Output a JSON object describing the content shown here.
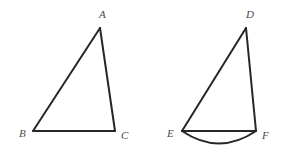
{
  "figure": {
    "background_color": "#ffffff",
    "stroke_color": "#262626",
    "label_color": "#4a4a4a",
    "stroke_width": 2,
    "shapes": [
      {
        "name": "triangle-abc",
        "type": "triangle",
        "vertices": [
          {
            "label": "A",
            "x": 100,
            "y": 28,
            "label_x": 99,
            "label_y": 9
          },
          {
            "label": "B",
            "x": 33,
            "y": 131,
            "label_x": 19,
            "label_y": 128
          },
          {
            "label": "C",
            "x": 115,
            "y": 131,
            "label_x": 121,
            "label_y": 130
          }
        ]
      },
      {
        "name": "triangle-def",
        "type": "triangle-with-arc",
        "vertices": [
          {
            "label": "D",
            "x": 246,
            "y": 28,
            "label_x": 246,
            "label_y": 9
          },
          {
            "label": "E",
            "x": 182,
            "y": 131,
            "label_x": 167,
            "label_y": 128
          },
          {
            "label": "F",
            "x": 256,
            "y": 131,
            "label_x": 262,
            "label_y": 130
          }
        ],
        "arc": {
          "name": "arc-ef",
          "from_x": 182,
          "from_y": 131,
          "to_x": 256,
          "to_y": 131,
          "bulge_y": 148
        }
      }
    ]
  }
}
